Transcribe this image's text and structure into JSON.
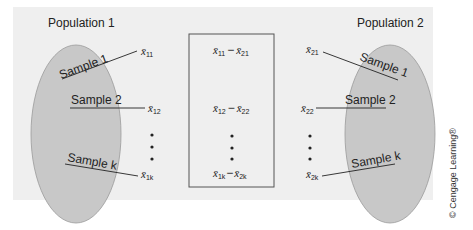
{
  "diagram": {
    "populations": [
      {
        "title": "Population 1",
        "samples": [
          {
            "label": "Sample 1",
            "mean_symbol": "x̄",
            "mean_sub": "11"
          },
          {
            "label": "Sample 2",
            "mean_symbol": "x̄",
            "mean_sub": "12"
          },
          {
            "label": "Sample k",
            "mean_symbol": "x̄",
            "mean_sub": "1k"
          }
        ]
      },
      {
        "title": "Population 2",
        "samples": [
          {
            "label": "Sample 1",
            "mean_symbol": "x̄",
            "mean_sub": "21"
          },
          {
            "label": "Sample 2",
            "mean_symbol": "x̄",
            "mean_sub": "22"
          },
          {
            "label": "Sample k",
            "mean_symbol": "x̄",
            "mean_sub": "2k"
          }
        ]
      }
    ],
    "differences": [
      {
        "a_sub": "11",
        "b_sub": "21"
      },
      {
        "a_sub": "12",
        "b_sub": "22"
      },
      {
        "a_sub": "1k",
        "b_sub": "2k"
      }
    ],
    "x_bar": "x̄",
    "minus": "−",
    "ellipsis_dots": "•",
    "credit": "© Cengage Learning®",
    "colors": {
      "panel": "#efefef",
      "ellipse_fill": "#c8c8c8",
      "ellipse_stroke": "#9a9a9a",
      "line": "#222222",
      "box_stroke": "#555555"
    }
  }
}
